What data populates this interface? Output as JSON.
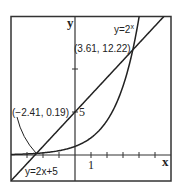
{
  "chart_data": {
    "type": "line",
    "title": "",
    "xlabel": "x",
    "ylabel": "y",
    "xlim": [
      -4,
      6
    ],
    "ylim": [
      -3,
      16.2
    ],
    "grid": false,
    "x_ticks": [
      -3,
      -2,
      -1,
      1,
      2,
      3,
      4,
      5
    ],
    "x_tick_labels": [
      {
        "value": 1,
        "label": "1"
      }
    ],
    "y_ticks": [
      5,
      10
    ],
    "y_tick_labels": [
      {
        "value": 5,
        "label": "5"
      }
    ],
    "series": [
      {
        "name": "y=2x+5",
        "label": "y=2x+5",
        "formula": "2x+5",
        "color": "#222222"
      },
      {
        "name": "y=2^x",
        "label": "y=2ˣ",
        "formula": "2^x",
        "color": "#222222"
      }
    ],
    "annotations": [
      {
        "text": "(3.61, 12.22)",
        "x": 3.61,
        "y": 12.22
      },
      {
        "text": "(−2.41, 0.19)",
        "x": -2.41,
        "y": 0.19
      }
    ]
  },
  "labels": {
    "x_axis": "x",
    "y_axis": "y",
    "line_label": "y=2x+5",
    "exp_label_base": "y=2",
    "exp_label_sup": "x",
    "point_upper": "(3.61, 12.22)",
    "point_lower": "(−2.41, 0.19)",
    "tick_x1": "1",
    "tick_y5": "5"
  }
}
